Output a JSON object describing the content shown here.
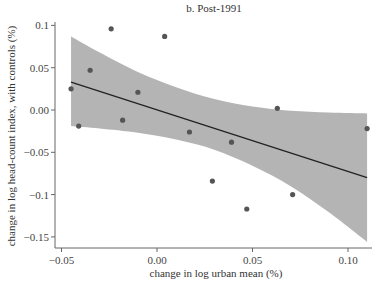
{
  "chart_data": {
    "type": "scatter",
    "title": "b. Post-1991",
    "xlabel": "change in log urban mean (%)",
    "ylabel": "change in log head-count index, with controls (%)",
    "xlim": [
      -0.052,
      0.112
    ],
    "ylim": [
      -0.162,
      0.105
    ],
    "x_ticks": [
      -0.05,
      0.0,
      0.05,
      0.1
    ],
    "x_tick_labels": [
      "−0.05",
      "0.00",
      "0.05",
      "0.10"
    ],
    "y_ticks": [
      0.1,
      0.05,
      0.0,
      -0.05,
      -0.1,
      -0.15
    ],
    "y_tick_labels": [
      "0.1",
      "0.05",
      "0.00",
      "−0.05",
      "−0.1",
      "−0.15"
    ],
    "grid": false,
    "legend": null,
    "points": [
      {
        "x": -0.045,
        "y": 0.025
      },
      {
        "x": -0.041,
        "y": -0.019
      },
      {
        "x": -0.035,
        "y": 0.047
      },
      {
        "x": -0.024,
        "y": 0.096
      },
      {
        "x": -0.018,
        "y": -0.012
      },
      {
        "x": -0.01,
        "y": 0.021
      },
      {
        "x": 0.004,
        "y": 0.087
      },
      {
        "x": 0.017,
        "y": -0.026
      },
      {
        "x": 0.029,
        "y": -0.084
      },
      {
        "x": 0.039,
        "y": -0.038
      },
      {
        "x": 0.047,
        "y": -0.117
      },
      {
        "x": 0.063,
        "y": 0.002
      },
      {
        "x": 0.071,
        "y": -0.1
      },
      {
        "x": 0.11,
        "y": -0.022
      }
    ],
    "fit_line": {
      "x": [
        -0.045,
        0.11
      ],
      "y": [
        0.033,
        -0.08
      ]
    },
    "confidence_band": {
      "x": [
        -0.045,
        -0.03,
        -0.01,
        0.01,
        0.03,
        0.05,
        0.07,
        0.09,
        0.11
      ],
      "upper": [
        0.087,
        0.068,
        0.045,
        0.027,
        0.013,
        0.004,
        -0.001,
        -0.003,
        -0.004
      ],
      "lower": [
        -0.019,
        -0.022,
        -0.027,
        -0.035,
        -0.047,
        -0.066,
        -0.09,
        -0.121,
        -0.156
      ]
    },
    "colors": {
      "point": "#555555",
      "line": "#222222",
      "band": "#b4b4b4",
      "axis": "#666666"
    }
  }
}
